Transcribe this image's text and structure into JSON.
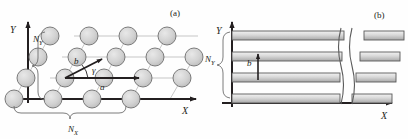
{
  "figure": {
    "background": "#fefefe",
    "stroke_dark": "#231f20",
    "stroke_grid": "#b9b9b9",
    "circle_fill": "#d2d2d2",
    "circle_stroke": "#6e6e6e",
    "bar_fill_top": "#efefef",
    "bar_fill_mid": "#b5b5b5",
    "bar_stroke": "#5a5a5a"
  },
  "panel_a": {
    "label": "(a)",
    "axis_y_label": "Y",
    "axis_x_label": "X",
    "brace_y_label": "N",
    "brace_y_sub": "Y",
    "brace_x_label": "N",
    "brace_x_sub": "X",
    "vector_a_label": "a",
    "vector_b_label": "b",
    "angle_label": "γ",
    "lattice": {
      "rows": 4,
      "cols": 4,
      "col_spacing": 39,
      "row_spacing": 21,
      "row_shear": 12,
      "circle_radius": 9,
      "origin_x": 14,
      "origin_y": 99
    }
  },
  "panel_b": {
    "label": "(b)",
    "axis_y_label": "Y",
    "axis_x_label": "X",
    "brace_y_label": "N",
    "brace_y_sub": "Y",
    "spacing_label": "b",
    "bars": {
      "count": 4,
      "row_spacing": 21,
      "thickness": 9,
      "left_x": 232,
      "bottom_y": 103,
      "break_x": 338,
      "stub_left": 352,
      "stub_right": 392
    }
  }
}
